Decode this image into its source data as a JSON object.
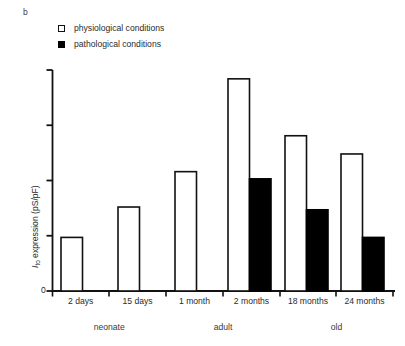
{
  "figure": {
    "panel_letter": "b",
    "legend": [
      {
        "label": "physiological conditions",
        "swatch": "open-square",
        "color": "#ffffff"
      },
      {
        "label": "pathological conditions",
        "swatch": "filled-square",
        "color": "#000000"
      }
    ],
    "y_axis_title_prefix": "I",
    "y_axis_title_subscript": "to",
    "y_axis_title_suffix": " expression (pS/pF)",
    "y_zero_label": "0"
  },
  "chart_data": {
    "type": "bar",
    "title": "",
    "subtitle": "",
    "xlabel": "",
    "ylabel": "Ito expression (pS/pF)",
    "categories": [
      "2 days",
      "15 days",
      "1 month",
      "2 months",
      "18 months",
      "24 months"
    ],
    "groups": [
      {
        "label": "neonate",
        "categories": [
          "2 days",
          "15 days"
        ]
      },
      {
        "label": "adult",
        "categories": [
          "1 month",
          "2 months"
        ]
      },
      {
        "label": "old",
        "categories": [
          "18 months",
          "24 months"
        ]
      }
    ],
    "series": [
      {
        "name": "physiological conditions",
        "fill": "#ffffff",
        "stroke": "#111111",
        "values": [
          0.97,
          1.52,
          2.16,
          3.84,
          2.81,
          2.48
        ]
      },
      {
        "name": "pathological conditions",
        "fill": "#000000",
        "stroke": "#000000",
        "values": [
          null,
          null,
          null,
          2.03,
          1.47,
          0.97
        ]
      }
    ],
    "ylim": [
      0,
      4.0
    ],
    "y_ticks": [
      0,
      1,
      2,
      3,
      4
    ],
    "y_tick_labels": [
      "0",
      "",
      "",
      "",
      ""
    ],
    "grid": false,
    "legend_position": "top-left",
    "axis_color": "#111111"
  }
}
